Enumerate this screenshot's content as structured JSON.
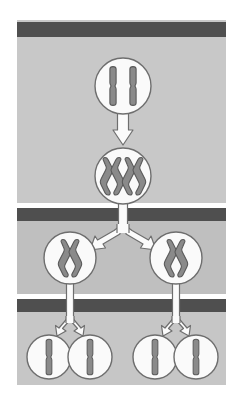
{
  "diagram": {
    "canvas": {
      "width": 236,
      "height": 403
    },
    "colors": {
      "page_background": "#ffffff",
      "panel_background": "#c8c8c8",
      "panel_background_band2": "#bdbdbd",
      "panel_background_band3": "#c4c4c4",
      "divider_dark": "#4f4f4f",
      "divider_white": "#ffffff",
      "cell_fill": "#fafafa",
      "cell_stroke": "#6e6e6e",
      "chromosome_fill": "#8a8a8a",
      "chromosome_stroke": "#5a5a5a",
      "arrow_fill": "#fbfbfb",
      "arrow_stroke": "#6e6e6e"
    },
    "panel": {
      "x": 17,
      "y": 20,
      "width": 209,
      "height": 365
    },
    "dividers": [
      {
        "name": "phase-divider-1",
        "y": 22,
        "height": 15,
        "white_gap_above": 0
      },
      {
        "name": "phase-divider-2",
        "y": 208,
        "height": 13,
        "white_gap_above": 5
      },
      {
        "name": "phase-divider-3",
        "y": 299,
        "height": 13,
        "white_gap_above": 5
      }
    ],
    "stages": [
      {
        "id": "stage-1",
        "label": "Parent cell with unreplicated chromosomes",
        "cell_count": 1,
        "chromosomes_per_cell": 2,
        "chromosome_shape": "rod",
        "cells": [
          {
            "cx": 123,
            "cy": 86,
            "r": 28
          }
        ]
      },
      {
        "id": "stage-2",
        "label": "Chromosomes replicated (sister chromatids)",
        "cell_count": 1,
        "chromosomes_per_cell": 2,
        "chromosome_shape": "x",
        "cells": [
          {
            "cx": 123,
            "cy": 176,
            "r": 28
          }
        ]
      },
      {
        "id": "stage-3",
        "label": "First division: two daughter cells",
        "cell_count": 2,
        "chromosomes_per_cell": 1,
        "chromosome_shape": "x",
        "cells": [
          {
            "cx": 70,
            "cy": 258,
            "r": 26
          },
          {
            "cx": 176,
            "cy": 258,
            "r": 26
          }
        ]
      },
      {
        "id": "stage-4",
        "label": "Second division: four daughter cells",
        "cell_count": 4,
        "chromosomes_per_cell": 1,
        "chromosome_shape": "rod",
        "cells": [
          {
            "cx": 49,
            "cy": 357,
            "r": 22
          },
          {
            "cx": 90,
            "cy": 357,
            "r": 22
          },
          {
            "cx": 155,
            "cy": 357,
            "r": 22
          },
          {
            "cx": 196,
            "cy": 357,
            "r": 22
          }
        ]
      }
    ],
    "arrows": [
      {
        "name": "arrow-stage1-to-stage2",
        "type": "straight-down",
        "x": 123,
        "from_y": 115,
        "to_y": 146
      },
      {
        "name": "splitter-stage2-to-stage3",
        "type": "y-split",
        "x": 123,
        "from_y": 205,
        "to_left_x": 70,
        "to_right_x": 176,
        "to_y": 232
      },
      {
        "name": "splitter-stage3-left",
        "type": "y-split",
        "x": 70,
        "from_y": 285,
        "to_left_x": 49,
        "to_right_x": 90,
        "to_y": 335
      },
      {
        "name": "splitter-stage3-right",
        "type": "y-split",
        "x": 176,
        "from_y": 285,
        "to_left_x": 155,
        "to_right_x": 196,
        "to_y": 335
      }
    ]
  }
}
